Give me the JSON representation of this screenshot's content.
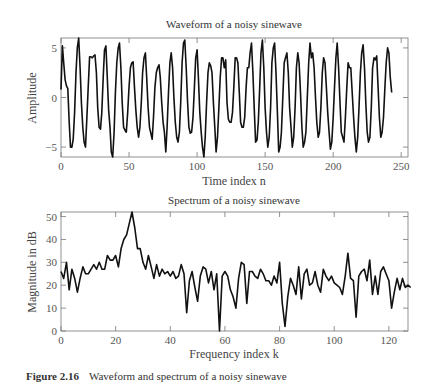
{
  "caption": {
    "label": "Figure 2.16",
    "text": "Waveform and spectrum of a noisy sinewave"
  },
  "chart_data": [
    {
      "type": "line",
      "title": "Waveform of a noisy sinewave",
      "xlabel": "Time index n",
      "ylabel": "Amplitude",
      "xlim": [
        0,
        255
      ],
      "ylim": [
        -6,
        6
      ],
      "xticks": [
        0,
        50,
        100,
        150,
        200,
        250
      ],
      "yticks": [
        -5,
        0,
        5
      ],
      "grid": false,
      "plot_box": {
        "x0": 61,
        "x1": 408,
        "y0": 38,
        "y1": 157
      },
      "x_step": 1,
      "values": [
        0.8,
        5.2,
        3.5,
        1.8,
        1.2,
        0.9,
        -2.5,
        -5.0,
        -5.0,
        -4.2,
        -1.5,
        2.5,
        5.0,
        6.0,
        3.0,
        -0.5,
        -3.0,
        -4.5,
        -5.0,
        -2.0,
        1.0,
        4.1,
        4.1,
        4.0,
        4.2,
        4.3,
        2.5,
        -1.0,
        -3.0,
        -3.2,
        -1.5,
        2.0,
        4.8,
        5.2,
        2.0,
        -1.2,
        -3.0,
        -5.5,
        -6.0,
        -3.5,
        0.5,
        3.5,
        5.0,
        5.5,
        3.0,
        -0.5,
        -3.0,
        -3.3,
        -3.5,
        -1.5,
        1.0,
        3.0,
        3.5,
        3.6,
        1.0,
        -1.2,
        -3.0,
        -4.0,
        -3.0,
        -0.5,
        2.5,
        4.0,
        4.5,
        2.0,
        -1.0,
        -3.0,
        -3.6,
        -4.2,
        -2.0,
        1.0,
        2.5,
        3.0,
        3.3,
        2.0,
        -0.5,
        -2.5,
        -3.5,
        -5.5,
        -3.0,
        0.5,
        3.5,
        4.5,
        3.0,
        0.0,
        -2.5,
        -4.0,
        -4.5,
        -3.5,
        -0.5,
        3.5,
        5.5,
        5.8,
        3.0,
        -0.5,
        -3.0,
        -3.6,
        -3.5,
        -2.0,
        1.0,
        4.0,
        4.8,
        2.0,
        -1.5,
        -3.5,
        -5.0,
        -6.0,
        -4.0,
        -0.5,
        2.5,
        3.5,
        3.2,
        2.5,
        -0.5,
        -3.0,
        -5.5,
        -4.0,
        -1.0,
        2.0,
        4.0,
        4.0,
        3.0,
        3.8,
        -0.5,
        -2.2,
        -2.5,
        -2.5,
        -1.5,
        1.0,
        4.0,
        4.0,
        3.5,
        0.5,
        -2.5,
        -3.0,
        -3.0,
        -2.0,
        1.0,
        3.0,
        3.0,
        4.5,
        5.5,
        2.5,
        -1.0,
        -4.5,
        -4.3,
        -2.5,
        1.0,
        4.5,
        5.8,
        3.0,
        -1.0,
        -3.5,
        -5.0,
        -4.0,
        -1.0,
        3.5,
        5.0,
        5.5,
        2.5,
        -1.5,
        -5.5,
        -5.0,
        -3.5,
        0.0,
        3.5,
        4.0,
        4.5,
        2.5,
        -1.0,
        -3.0,
        -5.0,
        -4.0,
        -1.0,
        3.0,
        4.5,
        3.5,
        0.5,
        -3.0,
        -5.0,
        -4.5,
        -3.5,
        0.0,
        3.5,
        5.5,
        4.0,
        4.5,
        3.0,
        0.0,
        -2.5,
        -4.0,
        -3.5,
        -1.0,
        2.5,
        4.0,
        3.5,
        1.0,
        -1.5,
        -3.5,
        -5.2,
        -4.5,
        -2.0,
        1.0,
        4.0,
        5.5,
        3.0,
        -0.5,
        -3.5,
        -4.0,
        -4.5,
        -2.0,
        1.0,
        3.5,
        3.0,
        3.0,
        0.5,
        -2.0,
        -4.0,
        -5.5,
        -4.0,
        -1.0,
        2.5,
        4.5,
        5.3,
        3.0,
        -0.5,
        -3.5,
        -4.5,
        -4.0,
        -1.0,
        3.0,
        4.0,
        3.8,
        4.2,
        1.0,
        -2.0,
        -4.0,
        -3.5,
        -2.0,
        1.0,
        3.5,
        5.0,
        4.5,
        2.0,
        0.5
      ]
    },
    {
      "type": "line",
      "title": "Spectrum of a noisy sinewave",
      "xlabel": "Frequency index k",
      "ylabel": "Magnitude in dB",
      "xlim": [
        0,
        127
      ],
      "ylim": [
        0,
        52
      ],
      "xticks": [
        0,
        20,
        40,
        60,
        80,
        100,
        120
      ],
      "yticks": [
        0,
        10,
        20,
        30,
        40,
        50
      ],
      "grid": false,
      "plot_box": {
        "x0": 61,
        "x1": 408,
        "y0": 212,
        "y1": 331
      },
      "x_step": 1,
      "values": [
        26,
        23,
        30,
        18,
        27,
        23,
        17,
        23,
        28,
        25,
        25,
        27,
        29,
        27,
        30,
        27,
        27,
        33,
        31,
        31,
        33,
        28,
        36,
        40,
        42,
        47,
        52,
        45,
        36,
        36,
        30,
        27,
        33,
        28,
        23,
        29,
        24,
        27,
        25,
        26,
        24,
        26,
        23,
        24,
        29,
        25,
        8,
        22,
        26,
        19,
        13,
        24,
        28,
        27,
        21,
        26,
        18,
        25,
        0,
        24,
        26,
        24,
        18,
        15,
        10,
        23,
        30,
        29,
        12,
        26,
        26,
        24,
        23,
        27,
        25,
        22,
        22,
        20,
        24,
        21,
        30,
        12,
        2,
        15,
        23,
        20,
        16,
        28,
        14,
        25,
        27,
        20,
        21,
        26,
        20,
        17,
        27,
        24,
        22,
        24,
        21,
        20,
        19,
        16,
        24,
        34,
        23,
        22,
        6,
        24,
        26,
        27,
        22,
        31,
        16,
        24,
        16,
        26,
        28,
        25,
        22,
        10,
        17,
        23,
        18,
        23,
        19,
        20,
        19
      ]
    }
  ]
}
